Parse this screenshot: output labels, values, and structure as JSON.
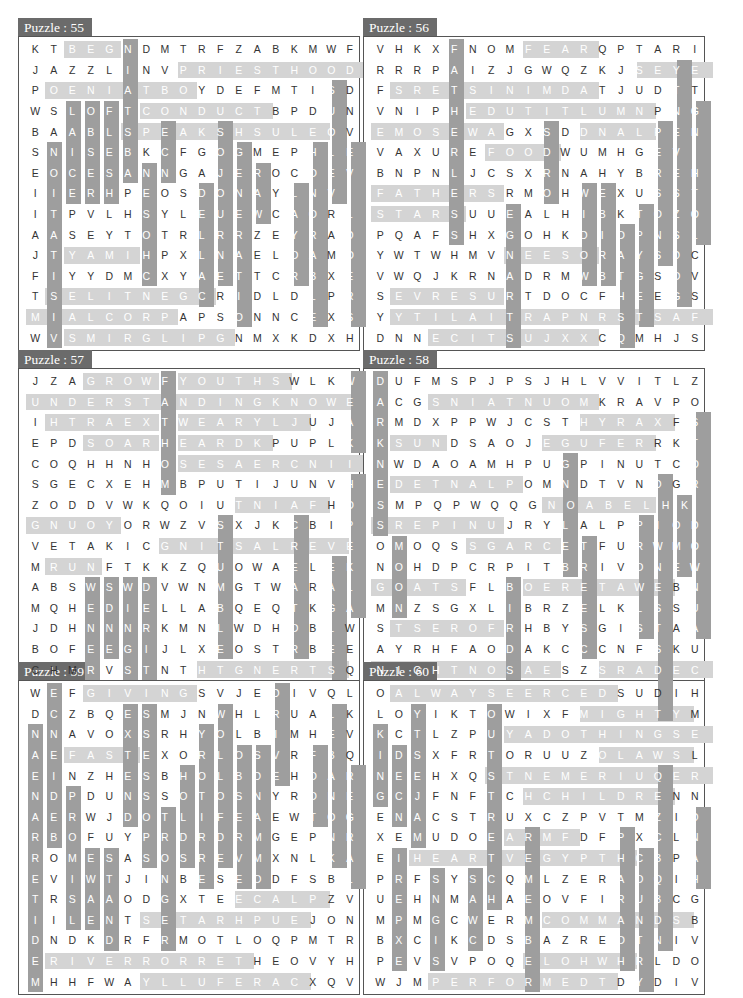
{
  "colors": {
    "title_bg": "#6b6b6b",
    "horizontal_highlight": "#d4d4d4",
    "vertical_highlight": "#9e9e9e",
    "border": "#555555"
  },
  "puzzles": [
    {
      "title": "Puzzle : 55",
      "grid": [
        "KTBEGNDMTRFZABKMWF",
        "JAZZLINVPRIESTHOOD",
        "POENIATBOYDEFMTISD",
        "WSLOFTCONDUCTBPDUN",
        "BAABLSPEAKSHSULEOV",
        "SNISEBKCFGOGMEPHLE",
        "EOCESANNGAJEROCOEV",
        "IIERHPEOSDONAYLNVI",
        "ITPVLHSYLEUEWCAORL",
        "AASEYTOTRLRRZEYRAD",
        "JTYAMIHPXLNAELOAMO",
        "FIYYDMCXYAETTCRBXE",
        "TSELITNEGCRIDLDLPR",
        "MIALCORPAPSONNCEXS",
        "WVSMIRGLIPGNMXKDXH"
      ],
      "words": [
        "BEG",
        "PRIESTHOOD",
        "OENIATBO",
        "CONDUCT",
        "SPEAKSHSUL",
        "NATIONS",
        "LABISE",
        "OBSER",
        "FLESHLY",
        "MAY",
        "GENTILES",
        "PROCLAIM",
        "PILGRIMS",
        "VISITATION",
        "SUOLEVNIRAME",
        "CHOSEN",
        "OJOURNERS",
        "GENERATION",
        "RAW",
        "LAYOR",
        "HONORABLE",
        "EVILDOERS",
        "DELLAC",
        "CNOSEH"
      ]
    },
    {
      "title": "Puzzle : 56",
      "grid": [
        "VHKXFNOMFEARQPTARI",
        "RRRPAIZJGWQZKJSEYE",
        "FSRETSINIMDATJUDTT",
        "VNIPHEDUTITLUMNPNG",
        "EMOSEWAGXSDDNALPEN",
        "VAXUREFOODWUMHGEVI",
        "BNPNLJCSXRNAHYBREH",
        "FATHERSRMOHWEXUSST",
        "STARSUUEALHIBKTOZO",
        "PQAFSHXGOHKDIOPNSL",
        "YWTWHMVNEESORAYSDC",
        "VWQJKRNADRMWBTGSOV",
        "SEVRESURTDOCFHEEGS",
        "YYTILAITRAPNRSTSAF",
        "DNNECITSUJXXCQMHJS"
      ],
      "words": [
        "FATHERLESS",
        "FEAR",
        "EYES",
        "MINISTERS",
        "MULTITUDE",
        "SOMEWA",
        "LAND",
        "FOOD",
        "FATHERS",
        "STARS",
        "STRANGERS",
        "SOL",
        "WIDOW",
        "BIRDS",
        "OATHS",
        "TYPE",
        "PERSONS",
        "SEVENTY",
        "NEES",
        "SERVES",
        "PARTIALITY",
        "JUSTICE",
        "FAST",
        "CLOTHING",
        "SDOG"
      ]
    },
    {
      "title": "Puzzle : 57",
      "grid": [
        "JZAGROWFYOUTHSWLKW",
        "UNDERSTANDINGKNOWE",
        "IHTRAEXTWEARYLJUJA",
        "EPDSOARHEARDKPUPLK",
        "COQHHNHOSESAERCNII",
        "SGECXEHMBPUTIJUNVH",
        "ZODDVWKQOIUTNIAFHO",
        "GNUOYORWZVSXJKCBIP",
        "VETAKICGNITSALREVE",
        "MRUNFTKKZQUOWAELEK",
        "ABSWSWDVWNMGTWARAL",
        "MQHEDIELLABQEQTKGA",
        "JDHNNNRKMNLWDHOBLW",
        "BOFEEGIJLXEOSTRBEE",
        "CHMRVSTNTHTGNERTSQ"
      ],
      "words": [
        "GROW",
        "YOUTHS",
        "FATHOM",
        "UNDERSTANDING",
        "KNOWE",
        "EARTH",
        "WEARY",
        "SOAR",
        "HEARD",
        "INCREASES",
        "WEAK",
        "FAINT",
        "YOUNG",
        "EVERLASTING",
        "RUN",
        "HOPE",
        "KLAW",
        "STUMBLE",
        "CREATOR",
        "EAGLES",
        "WENER",
        "SDNE",
        "WINGS",
        "DEIRT",
        "STRENGTH"
      ]
    },
    {
      "title": "Puzzle : 58",
      "grid": [
        "DUFMSPJPSJHLVVITLZ",
        "ACGSNIATNUOMKRAVPO",
        "RMDXPPWJCSTHYRAXFS",
        "KSUNDSAOJEGUFERRKT",
        "NWDAOAMHPUGPINUTCO",
        "EDETNALPOMNDTVNDGR",
        "SMPQPWQQGNOABELHK",
        "SREPINUJRYLALPPIOD",
        "OMOQSSGARCETFURWMO",
        "NOHDPCRPITBRIVONEW",
        "GOATSFLBOERETAWEBN",
        "MNZSGXLIBRZELKLSSU",
        "STSEROFRHBYSGISTAA",
        "AYRHFAODAKCCCNFSKU",
        "NIGHTNOSAESZSRADEC"
      ],
      "words": [
        "DARKNESS",
        "MOUNTAINS",
        "HYRAX",
        "SUN",
        "REFUGE",
        "PLANTED",
        "LEBANON",
        "STORKDOWN",
        "JUNIPERS",
        "CRAGS",
        "GOATS",
        "MOON",
        "BIRDS",
        "WATERE",
        "TREES",
        "PROWL",
        "DWELLS",
        "LIONS",
        "HOME",
        "FORESTS",
        "SEASON",
        "NIGHT",
        "CEDARS",
        "GNOLEB"
      ]
    },
    {
      "title": "Puzzle : 59",
      "grid": [
        "WEFGIVINGSVJEDIVQL",
        "DCZBQESMJNWHLRUALK",
        "NNAVOXSRHYOLBIMHEV",
        "AEFASTEXORLOSVRFBQ",
        "EINZHESBHOLBDEHOAR",
        "NDPDUNSSOTOSNYRONE",
        "AERWJDOTLIFEAEWTOG",
        "RBOFUYPRDRDRMGEPNR",
        "ROMESASOSREVMXNLKA",
        "EVIWTJINBESEODFSBL",
        "TRSAAODGXTEECALPZV",
        "IILENTSETARHPUEJON",
        "DNDKDRFRMOTLOQPMTR",
        "ERIVERRORRETHEOVYH",
        "MHHFWAYLLUFERACXQV"
      ],
      "words": [
        "GIVING",
        "FAST",
        "NAENAR",
        "ECNEIDEBO",
        "EXTEND",
        "SSESSOP",
        "WOLLOFD",
        "YROTIR",
        "DRIVE",
        "LEBANON",
        "REGRAL",
        "PROMISED",
        "SWALK",
        "STAND",
        "PSID",
        "STORNG",
        "HOLD",
        "OBSERVE",
        "SDNAMMOC",
        "FOOT",
        "RETIREDM",
        "PLACE",
        "UPHRATES",
        "RIVERRORRET",
        "CAREFULLY"
      ]
    },
    {
      "title": "Puzzle : 60",
      "grid": [
        "OALWAYSEERCEDSUDIH",
        "LOYIKTOWIXFMIGHTYM",
        "KCTLZPUYADOTHINGSE",
        "IDSXFRTORUUZOLAWSL",
        "NEEHXQSTNEMERIUQER",
        "GCJFNFTCHCHILDRENN",
        "ENACSTRUXCZPVTMZID",
        "XEMUDOEARMFDFPXCLN",
        "EIHEARTVEGYPTHCBPA",
        "PRFSYSCQMLZERAOQIH",
        "UEHNMAHAEOVFIRUBCG",
        "MPMGCWERMCOMMANDSB",
        "BXCIKCDSBAZREOTNIV",
        "PEVSVPOQELOHWHRLDO",
        "WJMPERFORMEDTDYDIV"
      ],
      "words": [
        "ALWAYS",
        "DECREES",
        "MIGHTY",
        "KING",
        "OUTSTRETCHED",
        "YADOTHINGS",
        "LAWS",
        "REQUIREMENTS",
        "CHILDREN",
        "NILPICSID",
        "DNAH",
        "ARM",
        "HEART",
        "EGYPT",
        "PHARAOH",
        "COUNTRY",
        "REMEMBER",
        "SNGIS",
        "SAW",
        "EXPERIENCED",
        "COMMANDS",
        "ELOHW",
        "PERFORMED",
        "TSEJAM"
      ]
    }
  ]
}
